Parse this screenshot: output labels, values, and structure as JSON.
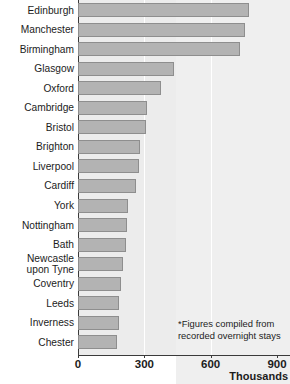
{
  "chart_data": {
    "type": "bar",
    "orientation": "horizontal",
    "title": "",
    "xlabel": "Thousands",
    "ylabel": "",
    "xlim": [
      0,
      900
    ],
    "grid": true,
    "gridlines": [
      300,
      600
    ],
    "legend": null,
    "xticks": [
      "0",
      "300",
      "600",
      "900"
    ],
    "xtick_values": [
      0,
      300,
      600,
      900
    ],
    "categories": [
      "Edinburgh",
      "Manchester",
      "Birmingham",
      "Glasgow",
      "Oxford",
      "Cambridge",
      "Bristol",
      "Brighton",
      "Liverpool",
      "Cardiff",
      "York",
      "Nottingham",
      "Bath",
      "Newcastle\nupon Tyne",
      "Coventry",
      "Leeds",
      "Inverness",
      "Chester"
    ],
    "values": [
      775,
      755,
      733,
      434,
      375,
      312,
      308,
      280,
      276,
      262,
      226,
      222,
      217,
      204,
      195,
      186,
      186,
      177
    ],
    "annotations": [
      "*Figures compiled from",
      "recorded overnight stays"
    ],
    "bar_color": "#b3b3b3",
    "bar_border_color": "#8e8e8e",
    "text_color": "#1c1c1c"
  }
}
